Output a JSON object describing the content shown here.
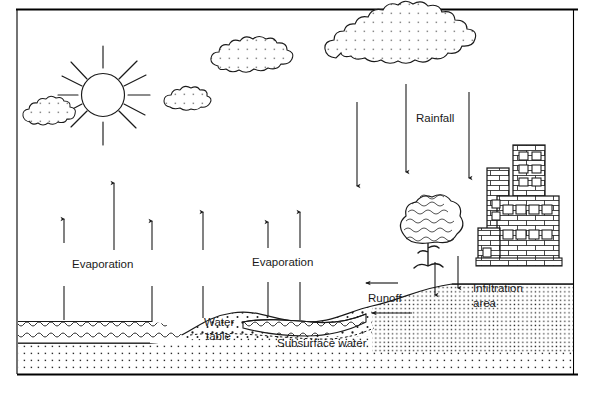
{
  "figure": {
    "type": "diagram",
    "frame": {
      "top_rule": true,
      "bottom_rule": true,
      "side_rules": true,
      "color": "#000000"
    }
  },
  "labels": {
    "rainfall": "Rainfall",
    "evaporation_left": "Evaporation",
    "evaporation_right": "Evaporation",
    "water_table_line1": "Water",
    "water_table_line2": "table",
    "subsurface_water": "Subsurface water",
    "runoff": "Runoff",
    "infiltration_line1": "Infiltration",
    "infiltration_line2": "area"
  },
  "elements": {
    "sun": {
      "name": "sun",
      "rays": 12
    },
    "clouds": [
      {
        "name": "cloud-small-left",
        "stippled": true
      },
      {
        "name": "cloud-small-mid",
        "stippled": true
      },
      {
        "name": "cloud-medium",
        "stippled": true
      },
      {
        "name": "cloud-rain",
        "stippled": true
      }
    ],
    "tree": {
      "name": "tree",
      "foliage": "scalloped"
    },
    "buildings": {
      "name": "city-buildings",
      "pattern": "brick",
      "towers": 4
    },
    "ground": {
      "name": "ground-cross-section",
      "pattern": "stipple"
    },
    "water_body": {
      "name": "lake",
      "pattern": "wave-lines",
      "wave_rows": 3
    }
  },
  "arrows": {
    "rainfall_down": 3,
    "evaporation_up_left": 3,
    "evaporation_up_right": 3,
    "infiltration_down": 2,
    "runoff_left": 2
  },
  "colors": {
    "ink": "#1a1a1a",
    "rule": "#000000",
    "stipple": "#333333",
    "paper": "#ffffff"
  }
}
